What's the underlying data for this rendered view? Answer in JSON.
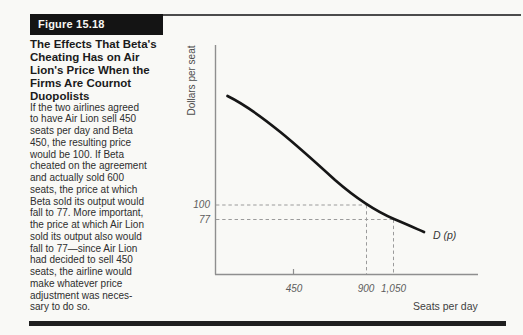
{
  "figure": {
    "label": "Figure 15.18",
    "title_lines": [
      "The Effects That Beta's",
      "Cheating Has on Air",
      "Lion's Price When the",
      "Firms Are Cournot",
      "Duopolists"
    ],
    "description_lines": [
      "If the two airlines agreed",
      "to have Air Lion sell 450",
      "seats per day and Beta",
      "450, the resulting price",
      "would be 100. If Beta",
      "cheated on the agreement",
      "and actually sold 600",
      "seats, the price at which",
      "Beta sold its output would",
      "fall to 77. More important,",
      "the price at which Air Lion",
      "sold its output also would",
      "fall to 77—since Air Lion",
      "had decided to sell 450",
      "seats, the airline would",
      "make whatever price",
      "adjustment was neces-",
      "sary to do so."
    ]
  },
  "chart_data": {
    "type": "line",
    "title": "",
    "xlabel": "Seats per day",
    "ylabel": "Dollars per seat",
    "curve_label": "D (p)",
    "x_tick_labels": [
      "450",
      "900",
      "1,050"
    ],
    "y_tick_labels": [
      "100",
      "77"
    ],
    "series": [
      {
        "name": "D(p) demand curve",
        "points_approx": [
          [
            75,
            280
          ],
          [
            450,
            200
          ],
          [
            700,
            140
          ],
          [
            900,
            100
          ],
          [
            1050,
            77
          ],
          [
            1230,
            56
          ]
        ]
      }
    ],
    "key_points": [
      {
        "quantity": 900,
        "price": 100,
        "note": "agreed output 450 + 450"
      },
      {
        "quantity": 1050,
        "price": 77,
        "note": "Beta cheats: 450 + 600"
      }
    ],
    "guides": [
      {
        "price": "100",
        "quantity": "900",
        "style": "dashed"
      },
      {
        "price": "77",
        "quantity": "1,050",
        "style": "dashed"
      }
    ],
    "layout": {
      "grid": false,
      "legend": "none",
      "x_ticks_marked": [
        "450"
      ]
    },
    "colors": {
      "axis": "#8f8f8f",
      "curve": "#161616",
      "dash": "#9b9b9b",
      "label_box_bg": "#141414",
      "label_box_text": "#f6f6f2"
    }
  }
}
